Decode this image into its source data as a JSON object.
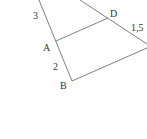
{
  "diagram": {
    "labels": {
      "A": "A",
      "B": "B",
      "D": "D",
      "seg_upper_left": "3",
      "seg_AB": "2",
      "seg_D_right": "1,5"
    },
    "colors": {
      "line": "#707070",
      "text": "#333333",
      "background": "#ffffff"
    }
  }
}
